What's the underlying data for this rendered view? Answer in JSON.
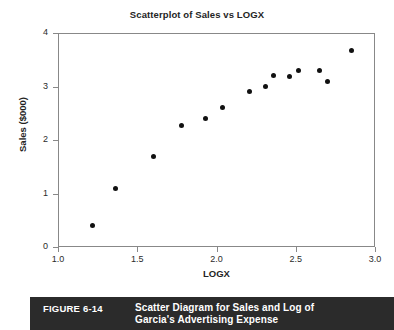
{
  "chart_data": {
    "type": "scatter",
    "title": "Scatterplot of Sales vs LOGX",
    "xlabel": "LOGX",
    "ylabel": "Sales ($000)",
    "xlim": [
      1.0,
      3.0
    ],
    "ylim": [
      0,
      4
    ],
    "grid": false,
    "legend": null,
    "xticks": [
      "1.0",
      "1.5",
      "2.0",
      "2.5",
      "3.0"
    ],
    "xtick_values": [
      1.0,
      1.5,
      2.0,
      2.5,
      3.0
    ],
    "yticks": [
      "0",
      "1",
      "2",
      "3",
      "4"
    ],
    "ytick_values": [
      0,
      1,
      2,
      3,
      4
    ],
    "series": [
      {
        "name": "Sales vs LOGX",
        "marker": "filled-circle",
        "color": "#111111",
        "points": [
          {
            "x": 1.22,
            "y": 0.4
          },
          {
            "x": 1.36,
            "y": 1.1
          },
          {
            "x": 1.6,
            "y": 1.7
          },
          {
            "x": 1.78,
            "y": 2.28
          },
          {
            "x": 1.93,
            "y": 2.4
          },
          {
            "x": 2.04,
            "y": 2.6
          },
          {
            "x": 2.21,
            "y": 2.9
          },
          {
            "x": 2.31,
            "y": 3.0
          },
          {
            "x": 2.36,
            "y": 3.2
          },
          {
            "x": 2.46,
            "y": 3.19
          },
          {
            "x": 2.52,
            "y": 3.3
          },
          {
            "x": 2.65,
            "y": 3.3
          },
          {
            "x": 2.7,
            "y": 3.09
          },
          {
            "x": 2.85,
            "y": 3.67
          }
        ]
      }
    ]
  },
  "caption": {
    "number": "FIGURE 6-14",
    "line1": "Scatter Diagram for Sales and Log of",
    "line2": "Garcia's Advertising Expense"
  },
  "colors": {
    "marker": "#111111",
    "frame": "#888888",
    "caption_bar": "#2b2b2b",
    "caption_text": "#ffffff"
  }
}
